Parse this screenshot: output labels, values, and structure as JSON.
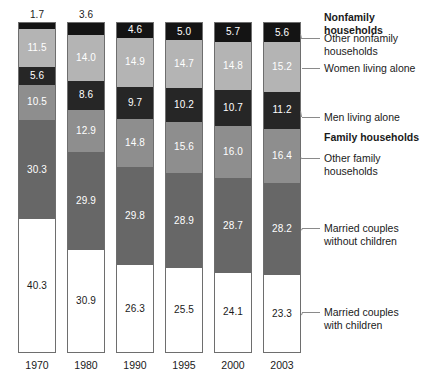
{
  "chart_data": {
    "type": "bar",
    "subtype": "stacked-bar-100-percent",
    "title": "",
    "subtitle": "",
    "xlabel": "",
    "ylabel": "",
    "ylim": [
      0,
      100
    ],
    "grid": false,
    "legend_position": "right",
    "units": "percent",
    "categories": [
      "1970",
      "1980",
      "1990",
      "1995",
      "2000",
      "2003"
    ],
    "series": [
      {
        "name": "Married couples with children",
        "group": "Family households",
        "color": "#ffffff",
        "label_color": "#1a1a1a",
        "values": [
          40.3,
          30.9,
          26.3,
          25.5,
          24.1,
          23.3
        ]
      },
      {
        "name": "Married couples without children",
        "group": "Family households",
        "color": "#676767",
        "label_color": "#ffffff",
        "values": [
          30.3,
          29.9,
          29.8,
          28.9,
          28.7,
          28.2
        ]
      },
      {
        "name": "Other family households",
        "group": "Family households",
        "color": "#8e8e8e",
        "label_color": "#ffffff",
        "values": [
          10.5,
          12.9,
          14.8,
          15.6,
          16.0,
          16.4
        ]
      },
      {
        "name": "Men living alone",
        "group": "Nonfamily households",
        "color": "#262626",
        "label_color": "#ffffff",
        "values": [
          5.6,
          8.6,
          9.7,
          10.2,
          10.7,
          11.2
        ]
      },
      {
        "name": "Women living alone",
        "group": "Nonfamily households",
        "color": "#b4b4b4",
        "label_color": "#ffffff",
        "values": [
          11.5,
          14.0,
          14.9,
          14.7,
          14.8,
          15.2
        ]
      },
      {
        "name": "Other nonfamily households",
        "group": "Nonfamily households",
        "color": "#141414",
        "label_color": "#ffffff",
        "values": [
          1.7,
          3.6,
          4.6,
          5.0,
          5.7,
          5.6
        ]
      }
    ],
    "annotations": [
      {
        "text": "1.7",
        "series": "Other nonfamily households",
        "category": "1970",
        "placement": "above-bar",
        "reason": "segment too thin for interior label"
      }
    ]
  },
  "legend": {
    "entries": [
      {
        "kind": "group-heading",
        "text": "Nonfamily\nhouseholds",
        "leader": false
      },
      {
        "kind": "series",
        "text": "Other nonfamily\nhouseholds",
        "series": "Other nonfamily households",
        "leader": true
      },
      {
        "kind": "series",
        "text": "Women living alone",
        "series": "Women living alone",
        "leader": true
      },
      {
        "kind": "series",
        "text": "Men living alone",
        "series": "Men living alone",
        "leader": true
      },
      {
        "kind": "group-heading",
        "text": "Family households",
        "leader": false
      },
      {
        "kind": "series",
        "text": "Other family\nhouseholds",
        "series": "Other family households",
        "leader": true
      },
      {
        "kind": "series",
        "text": "Married couples\nwithout children",
        "series": "Married couples without children",
        "leader": true
      },
      {
        "kind": "series",
        "text": "Married couples\nwith children",
        "series": "Married couples with children",
        "leader": true
      }
    ]
  },
  "axis": {
    "x_tick_labels": [
      "1970",
      "1980",
      "1990",
      "1995",
      "2000",
      "2003"
    ]
  },
  "colors": {
    "other_nonfamily": "#141414",
    "women_alone": "#b4b4b4",
    "men_alone": "#262626",
    "other_family": "#8e8e8e",
    "married_no_children": "#676767",
    "married_with_children": "#ffffff",
    "bar_outline": "#6e6e6e",
    "text": "#1a1a1a",
    "leader_line": "#8a8a8a",
    "background": "#ffffff"
  },
  "layout": {
    "bar_left_positions": [
      18,
      67,
      116,
      165,
      214,
      263
    ],
    "bar_width": 38,
    "baseline_y": 353,
    "scale_px_per_unit": 3.29
  }
}
